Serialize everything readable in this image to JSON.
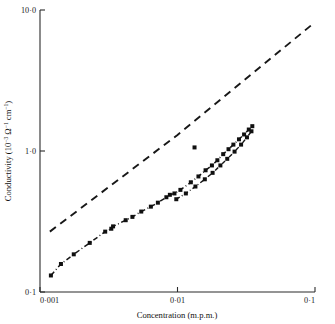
{
  "chart_data": {
    "type": "scatter",
    "title": "",
    "subtitle": "",
    "xlabel": "Concentration   (m.p.m.)",
    "ylabel": "Conductivity  (10⁻³ Ω⁻¹ cm⁻¹)",
    "ylabel_parts": {
      "text_main": "Conductivity  (10",
      "exp1": "−3",
      "text_mid": " Ω",
      "exp2": "−1",
      "text_mid2": " cm",
      "exp3": "−1",
      "text_end": ")"
    },
    "xscale": "log",
    "yscale": "log",
    "xlim": [
      0.001,
      0.1
    ],
    "ylim": [
      0.1,
      10.0
    ],
    "grid": false,
    "legend": "none",
    "xticks": [
      0.001,
      0.01,
      0.1
    ],
    "xticklabels": [
      "0·001",
      "0·01",
      "0·1"
    ],
    "yticks": [
      0.1,
      1.0,
      10.0
    ],
    "yticklabels": [
      "0·1",
      "1·0",
      "10·0"
    ],
    "series": [
      {
        "name": "reference-line",
        "style": "dashed",
        "marker": "none",
        "points": [
          [
            0.00118,
            0.268
          ],
          [
            0.01,
            1.3
          ],
          [
            0.0955,
            7.9
          ]
        ]
      },
      {
        "name": "measured-branch-main",
        "style": "dash-dot",
        "marker": "filled-square",
        "points": [
          [
            0.0012,
            0.131
          ],
          [
            0.00142,
            0.158
          ],
          [
            0.00176,
            0.185
          ],
          [
            0.0023,
            0.223
          ],
          [
            0.00298,
            0.268
          ],
          [
            0.0033,
            0.281
          ],
          [
            0.0034,
            0.292
          ],
          [
            0.0042,
            0.323
          ],
          [
            0.0047,
            0.341
          ],
          [
            0.00545,
            0.372
          ],
          [
            0.0064,
            0.403
          ],
          [
            0.0072,
            0.43
          ],
          [
            0.0083,
            0.47
          ],
          [
            0.0088,
            0.489
          ],
          [
            0.0095,
            0.5
          ],
          [
            0.0105,
            0.53
          ],
          [
            0.0125,
            0.6
          ],
          [
            0.0142,
            0.66
          ],
          [
            0.016,
            0.73
          ],
          [
            0.0178,
            0.79
          ],
          [
            0.0195,
            0.86
          ],
          [
            0.0215,
            0.95
          ],
          [
            0.0235,
            1.03
          ],
          [
            0.0255,
            1.11
          ],
          [
            0.028,
            1.21
          ],
          [
            0.0305,
            1.31
          ],
          [
            0.033,
            1.42
          ],
          [
            0.035,
            1.5
          ]
        ]
      },
      {
        "name": "measured-branch-lower",
        "style": "dash-dot",
        "marker": "filled-square",
        "points": [
          [
            0.0098,
            0.455
          ],
          [
            0.0115,
            0.5
          ],
          [
            0.0135,
            0.56
          ],
          [
            0.0158,
            0.63
          ],
          [
            0.018,
            0.7
          ],
          [
            0.0205,
            0.79
          ],
          [
            0.023,
            0.88
          ],
          [
            0.026,
            0.99
          ],
          [
            0.029,
            1.11
          ],
          [
            0.032,
            1.25
          ],
          [
            0.0345,
            1.38
          ]
        ]
      },
      {
        "name": "outlier-point",
        "style": "none",
        "marker": "filled-square",
        "points": [
          [
            0.0133,
            1.06
          ]
        ]
      }
    ]
  },
  "figure": {
    "plot_area": {
      "left": 40,
      "right": 315,
      "top": 10,
      "bottom": 292
    }
  }
}
